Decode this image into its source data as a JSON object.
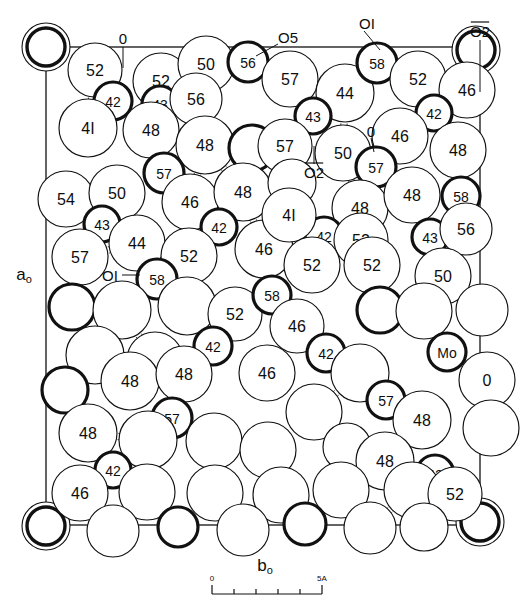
{
  "figure": {
    "type": "crystal-structure-packing-diagram"
  },
  "axes": {
    "vertical_label": "a",
    "vertical_sub": "o",
    "horizontal_label": "b",
    "horizontal_sub": "o"
  },
  "scale_bar": {
    "left_label": "0",
    "right_label": "5A",
    "divisions": 5
  },
  "legend": {
    "metal_label": "Mo",
    "oxygen_label": "O"
  },
  "bond_labels": [
    {
      "id": "bl0",
      "text": "0",
      "overline": false,
      "x": 123,
      "y": 38
    },
    {
      "id": "bl1",
      "text": "O5",
      "overline": false,
      "x": 288,
      "y": 37
    },
    {
      "id": "bl2",
      "text": "OI",
      "overline": false,
      "x": 367,
      "y": 23
    },
    {
      "id": "bl3",
      "text": "O2",
      "overline": true,
      "x": 480,
      "y": 31
    },
    {
      "id": "bl4",
      "text": "O2",
      "overline": true,
      "x": 314,
      "y": 172
    },
    {
      "id": "bl5",
      "text": "0",
      "overline": false,
      "x": 371,
      "y": 131
    },
    {
      "id": "bl6",
      "text": "OI",
      "overline": false,
      "x": 110,
      "y": 275
    }
  ],
  "atoms": [
    {
      "x": 46,
      "y": 47,
      "r": 24,
      "style": "mo-double",
      "label": ""
    },
    {
      "x": 476,
      "y": 50,
      "r": 24,
      "style": "mo-double",
      "label": ""
    },
    {
      "x": 46,
      "y": 526,
      "r": 24,
      "style": "mo-double",
      "label": ""
    },
    {
      "x": 480,
      "y": 522,
      "r": 24,
      "style": "mo-double",
      "label": ""
    },
    {
      "x": 95,
      "y": 70,
      "r": 27,
      "style": "thin",
      "label": "52"
    },
    {
      "x": 161,
      "y": 81,
      "r": 28,
      "style": "thin",
      "label": "52"
    },
    {
      "x": 206,
      "y": 64,
      "r": 28,
      "style": "thin",
      "label": "50"
    },
    {
      "x": 248,
      "y": 62,
      "r": 20,
      "style": "thick",
      "label": "56"
    },
    {
      "x": 290,
      "y": 79,
      "r": 28,
      "style": "thin",
      "label": "57"
    },
    {
      "x": 345,
      "y": 93,
      "r": 29,
      "style": "thin",
      "label": "44"
    },
    {
      "x": 377,
      "y": 63,
      "r": 20,
      "style": "thick",
      "label": "58"
    },
    {
      "x": 418,
      "y": 79,
      "r": 28,
      "style": "thin",
      "label": "52"
    },
    {
      "x": 467,
      "y": 90,
      "r": 28,
      "style": "thin",
      "label": "46"
    },
    {
      "x": 113,
      "y": 101,
      "r": 19,
      "style": "thick",
      "label": "42"
    },
    {
      "x": 160,
      "y": 104,
      "r": 18,
      "style": "thick",
      "label": "43"
    },
    {
      "x": 196,
      "y": 99,
      "r": 26,
      "style": "thin",
      "label": "56"
    },
    {
      "x": 313,
      "y": 116,
      "r": 18,
      "style": "thick",
      "label": "43"
    },
    {
      "x": 434,
      "y": 113,
      "r": 18,
      "style": "thick",
      "label": "42"
    },
    {
      "x": 88,
      "y": 128,
      "r": 29,
      "style": "thin",
      "label": "4I"
    },
    {
      "x": 151,
      "y": 130,
      "r": 28,
      "style": "thin",
      "label": "48"
    },
    {
      "x": 205,
      "y": 145,
      "r": 29,
      "style": "thin",
      "label": "48"
    },
    {
      "x": 252,
      "y": 148,
      "r": 23,
      "style": "thick",
      "label": ""
    },
    {
      "x": 285,
      "y": 146,
      "r": 27,
      "style": "thin",
      "label": "57"
    },
    {
      "x": 343,
      "y": 153,
      "r": 28,
      "style": "thin",
      "label": "50"
    },
    {
      "x": 400,
      "y": 136,
      "r": 28,
      "style": "thin",
      "label": "46"
    },
    {
      "x": 458,
      "y": 150,
      "r": 28,
      "style": "thin",
      "label": "48"
    },
    {
      "x": 164,
      "y": 173,
      "r": 20,
      "style": "thick",
      "label": "57"
    },
    {
      "x": 376,
      "y": 167,
      "r": 20,
      "style": "thick",
      "label": "57"
    },
    {
      "x": 66,
      "y": 199,
      "r": 28,
      "style": "thin",
      "label": "54"
    },
    {
      "x": 117,
      "y": 193,
      "r": 28,
      "style": "thin",
      "label": "50"
    },
    {
      "x": 190,
      "y": 202,
      "r": 28,
      "style": "thin",
      "label": "46"
    },
    {
      "x": 243,
      "y": 192,
      "r": 29,
      "style": "thin",
      "label": "48"
    },
    {
      "x": 292,
      "y": 183,
      "r": 24,
      "style": "thin",
      "label": ""
    },
    {
      "x": 360,
      "y": 208,
      "r": 28,
      "style": "thin",
      "label": "48"
    },
    {
      "x": 412,
      "y": 195,
      "r": 28,
      "style": "thin",
      "label": "48"
    },
    {
      "x": 461,
      "y": 196,
      "r": 19,
      "style": "thick",
      "label": "58"
    },
    {
      "x": 102,
      "y": 224,
      "r": 18,
      "style": "thick",
      "label": "43"
    },
    {
      "x": 219,
      "y": 227,
      "r": 18,
      "style": "thick",
      "label": "42"
    },
    {
      "x": 324,
      "y": 236,
      "r": 19,
      "style": "thick",
      "label": "42"
    },
    {
      "x": 430,
      "y": 237,
      "r": 18,
      "style": "thick",
      "label": "43"
    },
    {
      "x": 80,
      "y": 257,
      "r": 28,
      "style": "thin",
      "label": "57"
    },
    {
      "x": 137,
      "y": 243,
      "r": 28,
      "style": "thin",
      "label": "44"
    },
    {
      "x": 189,
      "y": 256,
      "r": 28,
      "style": "thin",
      "label": "52"
    },
    {
      "x": 264,
      "y": 249,
      "r": 29,
      "style": "thin",
      "label": "46"
    },
    {
      "x": 289,
      "y": 215,
      "r": 27,
      "style": "thin",
      "label": "4I"
    },
    {
      "x": 361,
      "y": 240,
      "r": 27,
      "style": "thin",
      "label": "52"
    },
    {
      "x": 466,
      "y": 229,
      "r": 26,
      "style": "thin",
      "label": "56"
    },
    {
      "x": 157,
      "y": 279,
      "r": 20,
      "style": "thick",
      "label": "58"
    },
    {
      "x": 312,
      "y": 265,
      "r": 28,
      "style": "thin",
      "label": "52"
    },
    {
      "x": 372,
      "y": 265,
      "r": 28,
      "style": "thin",
      "label": "52"
    },
    {
      "x": 443,
      "y": 276,
      "r": 28,
      "style": "thin",
      "label": "50"
    },
    {
      "x": 72,
      "y": 307,
      "r": 23,
      "style": "thick",
      "label": ""
    },
    {
      "x": 122,
      "y": 310,
      "r": 29,
      "style": "thin",
      "label": ""
    },
    {
      "x": 187,
      "y": 306,
      "r": 29,
      "style": "thin",
      "label": ""
    },
    {
      "x": 235,
      "y": 314,
      "r": 27,
      "style": "thin",
      "label": "52"
    },
    {
      "x": 272,
      "y": 295,
      "r": 19,
      "style": "thick",
      "label": "58"
    },
    {
      "x": 297,
      "y": 326,
      "r": 27,
      "style": "thin",
      "label": "46"
    },
    {
      "x": 380,
      "y": 310,
      "r": 23,
      "style": "thick",
      "label": ""
    },
    {
      "x": 424,
      "y": 311,
      "r": 28,
      "style": "thin",
      "label": ""
    },
    {
      "x": 482,
      "y": 310,
      "r": 26,
      "style": "thin",
      "label": ""
    },
    {
      "x": 213,
      "y": 346,
      "r": 19,
      "style": "thick",
      "label": "42"
    },
    {
      "x": 326,
      "y": 353,
      "r": 19,
      "style": "thick",
      "label": "42"
    },
    {
      "x": 95,
      "y": 355,
      "r": 29,
      "style": "thin",
      "label": ""
    },
    {
      "x": 155,
      "y": 360,
      "r": 28,
      "style": "thin",
      "label": ""
    },
    {
      "x": 267,
      "y": 373,
      "r": 28,
      "style": "thin",
      "label": "46"
    },
    {
      "x": 360,
      "y": 373,
      "r": 29,
      "style": "thin",
      "label": ""
    },
    {
      "x": 447,
      "y": 352,
      "r": 19,
      "style": "thick",
      "label": "Mo"
    },
    {
      "x": 487,
      "y": 380,
      "r": 28,
      "style": "thin",
      "label": "0"
    },
    {
      "x": 65,
      "y": 390,
      "r": 23,
      "style": "thick",
      "label": ""
    },
    {
      "x": 130,
      "y": 381,
      "r": 29,
      "style": "thin",
      "label": "48"
    },
    {
      "x": 184,
      "y": 374,
      "r": 28,
      "style": "thin",
      "label": "48"
    },
    {
      "x": 314,
      "y": 412,
      "r": 28,
      "style": "thin",
      "label": ""
    },
    {
      "x": 386,
      "y": 400,
      "r": 19,
      "style": "thick",
      "label": "57"
    },
    {
      "x": 422,
      "y": 420,
      "r": 29,
      "style": "thin",
      "label": "48"
    },
    {
      "x": 491,
      "y": 428,
      "r": 28,
      "style": "thin",
      "label": ""
    },
    {
      "x": 172,
      "y": 418,
      "r": 20,
      "style": "thick",
      "label": "57"
    },
    {
      "x": 88,
      "y": 433,
      "r": 29,
      "style": "thin",
      "label": "48"
    },
    {
      "x": 148,
      "y": 440,
      "r": 29,
      "style": "thin",
      "label": ""
    },
    {
      "x": 214,
      "y": 441,
      "r": 28,
      "style": "thin",
      "label": ""
    },
    {
      "x": 268,
      "y": 450,
      "r": 28,
      "style": "thin",
      "label": ""
    },
    {
      "x": 347,
      "y": 447,
      "r": 24,
      "style": "thin",
      "label": ""
    },
    {
      "x": 385,
      "y": 461,
      "r": 29,
      "style": "thin",
      "label": "48"
    },
    {
      "x": 113,
      "y": 470,
      "r": 18,
      "style": "thick",
      "label": "42"
    },
    {
      "x": 435,
      "y": 474,
      "r": 19,
      "style": "thick",
      "label": "42"
    },
    {
      "x": 80,
      "y": 493,
      "r": 28,
      "style": "thin",
      "label": "46"
    },
    {
      "x": 147,
      "y": 492,
      "r": 28,
      "style": "thin",
      "label": ""
    },
    {
      "x": 215,
      "y": 493,
      "r": 28,
      "style": "thin",
      "label": ""
    },
    {
      "x": 281,
      "y": 495,
      "r": 28,
      "style": "thin",
      "label": ""
    },
    {
      "x": 341,
      "y": 490,
      "r": 28,
      "style": "thin",
      "label": ""
    },
    {
      "x": 412,
      "y": 490,
      "r": 28,
      "style": "thin",
      "label": ""
    },
    {
      "x": 455,
      "y": 494,
      "r": 27,
      "style": "thin",
      "label": "52"
    },
    {
      "x": 178,
      "y": 527,
      "r": 20,
      "style": "thick",
      "label": ""
    },
    {
      "x": 305,
      "y": 524,
      "r": 21,
      "style": "thick",
      "label": ""
    },
    {
      "x": 113,
      "y": 531,
      "r": 26,
      "style": "thin",
      "label": ""
    },
    {
      "x": 243,
      "y": 530,
      "r": 26,
      "style": "thin",
      "label": ""
    },
    {
      "x": 370,
      "y": 528,
      "r": 26,
      "style": "thin",
      "label": ""
    },
    {
      "x": 424,
      "y": 527,
      "r": 24,
      "style": "thin",
      "label": ""
    }
  ],
  "cell_box": {
    "x": 46,
    "y": 47,
    "width": 434,
    "height": 478
  },
  "colors": {
    "stroke": "#111111",
    "fill": "#ffffff",
    "background": "#ffffff"
  }
}
